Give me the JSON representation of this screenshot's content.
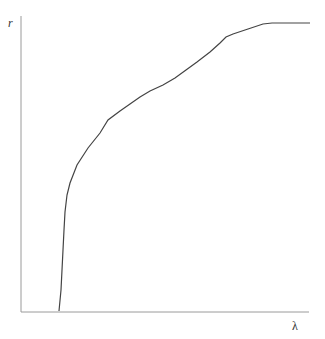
{
  "chart_data": {
    "type": "line",
    "title": "",
    "xlabel": "λ",
    "ylabel": "r",
    "grid": false,
    "legend": null,
    "ticks": {
      "x": [],
      "y": []
    },
    "series": [
      {
        "name": "r(λ)",
        "color": "#444444",
        "points_px": [
          [
            59,
            311
          ],
          [
            61,
            290
          ],
          [
            62,
            270
          ],
          [
            63,
            250
          ],
          [
            64,
            230
          ],
          [
            65,
            212
          ],
          [
            67,
            195
          ],
          [
            70,
            183
          ],
          [
            77,
            165
          ],
          [
            88,
            148
          ],
          [
            100,
            133
          ],
          [
            108,
            120
          ],
          [
            120,
            111
          ],
          [
            130,
            104
          ],
          [
            140,
            97
          ],
          [
            150,
            91
          ],
          [
            163,
            85
          ],
          [
            175,
            78
          ],
          [
            186,
            70
          ],
          [
            197,
            62
          ],
          [
            210,
            52
          ],
          [
            220,
            43
          ],
          [
            226,
            37
          ],
          [
            233,
            34
          ],
          [
            248,
            29
          ],
          [
            263,
            24
          ],
          [
            272,
            23
          ],
          [
            290,
            23
          ],
          [
            310,
            23
          ]
        ]
      }
    ]
  },
  "axes": {
    "y_label": "r",
    "x_label": "λ",
    "axis_color": "#9a9a9a"
  }
}
